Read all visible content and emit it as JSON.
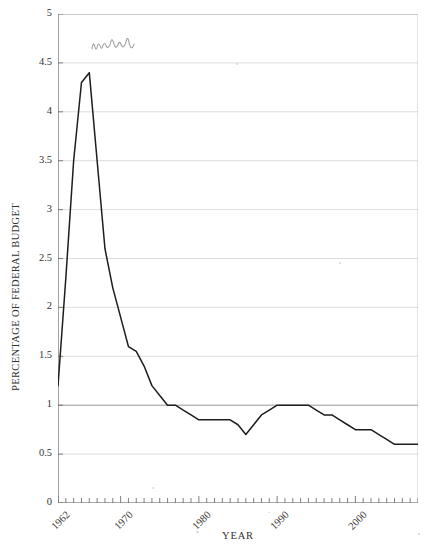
{
  "chart_data": {
    "type": "line",
    "title": "",
    "xlabel": "YEAR",
    "ylabel": "PERCENTAGE OF FEDERAL BUDGET",
    "xlim": [
      1962,
      2008
    ],
    "ylim": [
      0,
      5
    ],
    "grid": true,
    "legend": null,
    "y_ticks": [
      0,
      0.5,
      1,
      1.5,
      2,
      2.5,
      3,
      3.5,
      4,
      4.5,
      5
    ],
    "y_tick_labels": [
      "0",
      "0.5",
      "1",
      "1.5",
      "2",
      "2.5",
      "3",
      "3.5",
      "4",
      "4.5",
      "5"
    ],
    "x_ticks": [
      1962,
      1970,
      1980,
      1990,
      2000
    ],
    "x_tick_labels": [
      "1962",
      "1970",
      "1980",
      "1990",
      "2000"
    ],
    "x_minor_tick_step": 1,
    "line_color": "#1d1d1d",
    "grid_color": "#cfcfcf",
    "axis_color": "#555555",
    "x": [
      1962,
      1963,
      1964,
      1965,
      1966,
      1967,
      1968,
      1969,
      1970,
      1971,
      1972,
      1973,
      1974,
      1975,
      1976,
      1977,
      1978,
      1979,
      1980,
      1981,
      1982,
      1983,
      1984,
      1985,
      1986,
      1987,
      1988,
      1989,
      1990,
      1991,
      1992,
      1993,
      1994,
      1995,
      1996,
      1997,
      1998,
      1999,
      2000,
      2001,
      2002,
      2003,
      2004,
      2005,
      2006,
      2007,
      2008
    ],
    "values": [
      1.2,
      2.3,
      3.5,
      4.3,
      4.4,
      3.5,
      2.6,
      2.2,
      1.9,
      1.6,
      1.55,
      1.4,
      1.2,
      1.1,
      1.0,
      1.0,
      0.95,
      0.9,
      0.85,
      0.85,
      0.85,
      0.85,
      0.85,
      0.8,
      0.7,
      0.8,
      0.9,
      0.95,
      1.0,
      1.0,
      1.0,
      1.0,
      1.0,
      0.95,
      0.9,
      0.9,
      0.85,
      0.8,
      0.75,
      0.75,
      0.75,
      0.7,
      0.65,
      0.6,
      0.6,
      0.6,
      0.6
    ],
    "series_name": "Percentage of federal budget"
  },
  "annotations": {
    "handwritten_note": {
      "text": "wow",
      "style": "handwritten-pencil",
      "color": "#9a9a9a"
    }
  }
}
